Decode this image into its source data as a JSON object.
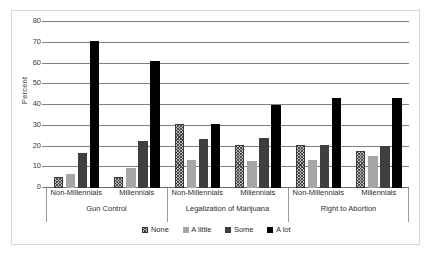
{
  "chart_data": {
    "type": "bar",
    "title": "",
    "subtitle": "",
    "xlabel": "",
    "ylabel": "Percent",
    "ylim": [
      0,
      80
    ],
    "yticks": [
      0,
      10,
      20,
      30,
      40,
      50,
      60,
      70,
      80
    ],
    "grid": true,
    "legend_position": "bottom",
    "legend": [
      "None",
      "A little",
      "Some",
      "A lot"
    ],
    "groups": [
      {
        "label": "Gun Control",
        "subgroups": [
          {
            "label": "Non-Millennials",
            "values": [
              5.2,
              6.6,
              16.8,
              71.0
            ]
          },
          {
            "label": "Millennials",
            "values": [
              5.2,
              9.8,
              22.8,
              61.0
            ]
          }
        ]
      },
      {
        "label": "Legalization of Marijuana",
        "subgroups": [
          {
            "label": "Non-Millennials",
            "values": [
              31.0,
              13.4,
              23.4,
              30.8
            ]
          },
          {
            "label": "Millennials",
            "values": [
              20.8,
              12.9,
              24.1,
              40.0
            ]
          }
        ]
      },
      {
        "label": "Right to Abortion",
        "subgroups": [
          {
            "label": "Non-Millennials",
            "values": [
              20.5,
              13.4,
              20.5,
              43.3
            ]
          },
          {
            "label": "Millennials",
            "values": [
              18.0,
              15.3,
              20.1,
              43.4
            ]
          }
        ]
      }
    ],
    "categories": [
      "Gun Control / Non-Millennials",
      "Gun Control / Millennials",
      "Legalization of Marijuana / Non-Millennials",
      "Legalization of Marijuana / Millennials",
      "Right to Abortion / Non-Millennials",
      "Right to Abortion / Millennials"
    ],
    "series": [
      {
        "name": "None",
        "values": [
          5.2,
          5.2,
          31.0,
          20.8,
          20.5,
          18.0
        ],
        "color": "#b8b8b8",
        "fill": "hatched"
      },
      {
        "name": "A little",
        "values": [
          6.6,
          9.8,
          13.4,
          12.9,
          13.4,
          15.3
        ],
        "color": "#a6a6a6",
        "fill": "solid"
      },
      {
        "name": "Some",
        "values": [
          16.8,
          22.8,
          23.4,
          24.1,
          20.5,
          20.1
        ],
        "color": "#3f3f3f",
        "fill": "solid"
      },
      {
        "name": "A lot",
        "values": [
          71.0,
          61.0,
          30.8,
          40.0,
          43.3,
          43.4
        ],
        "color": "#000000",
        "fill": "solid"
      }
    ]
  },
  "axis": {
    "y_title": "Percent",
    "y_tick_labels": [
      "0",
      "10",
      "20",
      "30",
      "40",
      "50",
      "60",
      "70",
      "80"
    ]
  },
  "colors": {
    "none": "#b8b8b8",
    "a_little": "#a6a6a6",
    "some": "#3f3f3f",
    "a_lot": "#000000",
    "gridline": "#808080",
    "frame": "#d8d8d8",
    "text": "#2e2e2e"
  }
}
